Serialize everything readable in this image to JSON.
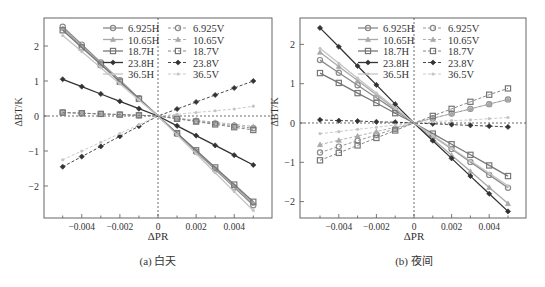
{
  "figure": {
    "panels": [
      {
        "id": "a",
        "caption": "(a) 白天",
        "xlabel": "ΔPR",
        "ylabel": "ΔBT/K"
      },
      {
        "id": "b",
        "caption": "(b) 夜间",
        "xlabel": "ΔPR",
        "ylabel": "ΔBT/K"
      }
    ]
  },
  "legend": {
    "entries": [
      {
        "label": "6.925H",
        "style": "solid",
        "marker": "circle",
        "color": "#8a8a8a"
      },
      {
        "label": "10.65H",
        "style": "solid",
        "marker": "triangle",
        "color": "#a8a8a8"
      },
      {
        "label": "18.7H",
        "style": "solid",
        "marker": "square",
        "color": "#777777"
      },
      {
        "label": "23.8H",
        "style": "solid",
        "marker": "diamond",
        "color": "#333333"
      },
      {
        "label": "36.5H",
        "style": "solid",
        "marker": "star",
        "color": "#c4c4c4"
      },
      {
        "label": "6.925V",
        "style": "dashed",
        "marker": "circle",
        "color": "#8a8a8a"
      },
      {
        "label": "10.65V",
        "style": "dashed",
        "marker": "triangle",
        "color": "#a8a8a8"
      },
      {
        "label": "18.7V",
        "style": "dashed",
        "marker": "square",
        "color": "#777777"
      },
      {
        "label": "23.8V",
        "style": "dashed",
        "marker": "diamond",
        "color": "#333333"
      },
      {
        "label": "36.5V",
        "style": "dashed",
        "marker": "star",
        "color": "#c4c4c4"
      }
    ]
  },
  "chart_data": [
    {
      "type": "line",
      "title": "(a) 白天",
      "xlabel": "ΔPR",
      "ylabel": "ΔBT/K",
      "xlim": [
        -0.006,
        0.006
      ],
      "ylim": [
        -2.9,
        2.8
      ],
      "xticks": [
        -0.004,
        -0.002,
        0,
        0.002,
        0.004
      ],
      "xtick_labels": [
        "−0.004",
        "−0.002",
        "0",
        "0.002",
        "0.004"
      ],
      "yticks": [
        -2,
        -1,
        0,
        1,
        2
      ],
      "ytick_labels": [
        "−2",
        "−1",
        "0",
        "1",
        "2"
      ],
      "grid": false,
      "zero_lines": true,
      "legend_position": "upper center, 2 columns",
      "x": [
        -0.005,
        -0.004,
        -0.003,
        -0.002,
        -0.001,
        0,
        0.001,
        0.002,
        0.003,
        0.004,
        0.005
      ],
      "series": [
        {
          "name": "6.925H",
          "slope": -510,
          "values": [
            2.55,
            2.04,
            1.53,
            1.02,
            0.51,
            0,
            -0.51,
            -1.02,
            -1.53,
            -2.04,
            -2.55
          ]
        },
        {
          "name": "10.65H",
          "slope": -500,
          "values": [
            2.5,
            2.0,
            1.5,
            1.0,
            0.5,
            0,
            -0.5,
            -1.0,
            -1.5,
            -2.0,
            -2.5
          ]
        },
        {
          "name": "18.7H",
          "slope": -490,
          "values": [
            2.45,
            1.96,
            1.47,
            0.98,
            0.49,
            0,
            -0.49,
            -0.98,
            -1.47,
            -1.96,
            -2.45
          ]
        },
        {
          "name": "23.8H",
          "slope": -210,
          "values": [
            1.05,
            0.84,
            0.63,
            0.42,
            0.21,
            0,
            -0.28,
            -0.56,
            -0.84,
            -1.12,
            -1.4
          ]
        },
        {
          "name": "36.5H",
          "slope": -500,
          "values": [
            2.3,
            1.84,
            1.38,
            0.92,
            0.46,
            0,
            -0.54,
            -1.08,
            -1.62,
            -2.16,
            -2.7
          ]
        },
        {
          "name": "6.925V",
          "slope": -20,
          "values": [
            0.1,
            0.08,
            0.06,
            0.04,
            0.02,
            0,
            -0.07,
            -0.14,
            -0.21,
            -0.28,
            -0.35
          ]
        },
        {
          "name": "10.65V",
          "slope": -20,
          "values": [
            0.1,
            0.08,
            0.06,
            0.04,
            0.02,
            0,
            -0.06,
            -0.12,
            -0.18,
            -0.24,
            -0.3
          ]
        },
        {
          "name": "18.7V",
          "slope": -20,
          "values": [
            0.1,
            0.08,
            0.06,
            0.04,
            0.02,
            0,
            -0.08,
            -0.16,
            -0.24,
            -0.32,
            -0.4
          ]
        },
        {
          "name": "23.8V",
          "slope": 200,
          "values": [
            -1.45,
            -1.16,
            -0.87,
            -0.58,
            -0.29,
            0,
            0.2,
            0.4,
            0.6,
            0.8,
            1.0
          ]
        },
        {
          "name": "36.5V",
          "slope": 250,
          "values": [
            -1.25,
            -1.0,
            -0.75,
            -0.5,
            -0.25,
            0,
            0.05,
            0.1,
            0.15,
            0.2,
            0.28
          ]
        }
      ]
    },
    {
      "type": "line",
      "title": "(b) 夜间",
      "xlabel": "ΔPR",
      "ylabel": "ΔBT/K",
      "xlim": [
        -0.006,
        0.006
      ],
      "ylim": [
        -2.42,
        2.67
      ],
      "xticks": [
        -0.004,
        -0.002,
        0,
        0.002,
        0.004
      ],
      "xtick_labels": [
        "−0.004",
        "−0.002",
        "0",
        "0.002",
        "0.004"
      ],
      "yticks": [
        -2,
        -1,
        0,
        1,
        2
      ],
      "ytick_labels": [
        "−2",
        "−1",
        "0",
        "1",
        "2"
      ],
      "grid": false,
      "zero_lines": true,
      "legend_position": "upper center, 2 columns",
      "x": [
        -0.005,
        -0.004,
        -0.003,
        -0.002,
        -0.001,
        0,
        0.001,
        0.002,
        0.003,
        0.004,
        0.005
      ],
      "series": [
        {
          "name": "6.925H",
          "values": [
            1.6,
            1.28,
            0.96,
            0.64,
            0.32,
            0,
            -0.33,
            -0.66,
            -0.99,
            -1.32,
            -1.65
          ]
        },
        {
          "name": "10.65H",
          "values": [
            1.8,
            1.44,
            1.08,
            0.72,
            0.36,
            0,
            -0.41,
            -0.82,
            -1.23,
            -1.64,
            -2.05
          ]
        },
        {
          "name": "18.7H",
          "values": [
            1.27,
            1.02,
            0.76,
            0.51,
            0.25,
            0,
            -0.27,
            -0.54,
            -0.81,
            -1.08,
            -1.35
          ]
        },
        {
          "name": "23.8H",
          "values": [
            2.42,
            1.94,
            1.45,
            0.97,
            0.48,
            0,
            -0.45,
            -0.9,
            -1.35,
            -1.8,
            -2.25
          ]
        },
        {
          "name": "36.5H",
          "values": [
            1.9,
            1.52,
            1.14,
            0.76,
            0.38,
            0,
            -0.32,
            -0.64,
            -0.96,
            -1.28,
            -1.6
          ]
        },
        {
          "name": "6.925V",
          "values": [
            -0.75,
            -0.6,
            -0.45,
            -0.3,
            -0.15,
            0,
            0.12,
            0.24,
            0.36,
            0.48,
            0.6
          ]
        },
        {
          "name": "10.65V",
          "values": [
            -0.55,
            -0.44,
            -0.33,
            -0.22,
            -0.11,
            0,
            0.12,
            0.24,
            0.36,
            0.48,
            0.6
          ]
        },
        {
          "name": "18.7V",
          "values": [
            -0.95,
            -0.76,
            -0.57,
            -0.38,
            -0.19,
            0,
            0.18,
            0.36,
            0.54,
            0.72,
            0.88
          ]
        },
        {
          "name": "23.8V",
          "values": [
            0.08,
            0.06,
            0.05,
            0.03,
            0.02,
            0,
            -0.02,
            -0.04,
            -0.06,
            -0.08,
            -0.1
          ]
        },
        {
          "name": "36.5V",
          "values": [
            -0.27,
            -0.22,
            -0.16,
            -0.11,
            -0.05,
            0,
            0.03,
            0.06,
            0.08,
            0.11,
            0.14
          ]
        }
      ]
    }
  ]
}
